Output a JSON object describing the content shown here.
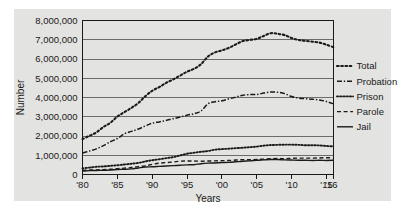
{
  "chart_data": {
    "type": "line",
    "title": "",
    "xlabel": "Years",
    "ylabel": "Number",
    "x": [
      1980,
      1981,
      1982,
      1983,
      1984,
      1985,
      1986,
      1987,
      1988,
      1989,
      1990,
      1991,
      1992,
      1993,
      1994,
      1995,
      1996,
      1997,
      1998,
      1999,
      2000,
      2001,
      2002,
      2003,
      2004,
      2005,
      2006,
      2007,
      2008,
      2009,
      2010,
      2011,
      2012,
      2013,
      2014,
      2015,
      2016
    ],
    "xtick_labels": [
      "'80",
      "'85",
      "'90",
      "'95",
      "'00",
      "'05",
      "'10",
      "'15",
      "'16"
    ],
    "xtick_values": [
      1980,
      1985,
      1990,
      1995,
      2000,
      2005,
      2010,
      2015,
      2016
    ],
    "ytick_labels": [
      "0",
      "1,000,000",
      "2,000,000",
      "3,000,000",
      "4,000,000",
      "5,000,000",
      "6,000,000",
      "7,000,000",
      "8,000,000"
    ],
    "ytick_values": [
      0,
      1000000,
      2000000,
      3000000,
      4000000,
      5000000,
      6000000,
      7000000,
      8000000
    ],
    "xlim": [
      1980,
      2016
    ],
    "ylim": [
      0,
      8000000
    ],
    "grid": "horizontal",
    "legend_position": "right",
    "series": [
      {
        "name": "Total",
        "style": "dotted",
        "values": [
          1840000,
          2010000,
          2190000,
          2470000,
          2690000,
          3010000,
          3240000,
          3460000,
          3710000,
          4060000,
          4350000,
          4540000,
          4760000,
          4940000,
          5140000,
          5340000,
          5490000,
          5730000,
          6130000,
          6340000,
          6450000,
          6580000,
          6760000,
          6930000,
          6990000,
          7050000,
          7200000,
          7340000,
          7310000,
          7240000,
          7090000,
          6990000,
          6940000,
          6900000,
          6850000,
          6740000,
          6610000
        ]
      },
      {
        "name": "Probation",
        "style": "dash-dot",
        "values": [
          1120000,
          1220000,
          1330000,
          1500000,
          1700000,
          1870000,
          2110000,
          2240000,
          2360000,
          2520000,
          2670000,
          2730000,
          2810000,
          2900000,
          2980000,
          3080000,
          3160000,
          3300000,
          3670000,
          3780000,
          3830000,
          3930000,
          4020000,
          4120000,
          4150000,
          4160000,
          4230000,
          4290000,
          4270000,
          4200000,
          4050000,
          3970000,
          3940000,
          3910000,
          3870000,
          3790000,
          3670000
        ]
      },
      {
        "name": "Prison",
        "style": "fine-dotted",
        "values": [
          320000,
          360000,
          400000,
          420000,
          450000,
          480000,
          520000,
          560000,
          600000,
          680000,
          740000,
          790000,
          850000,
          900000,
          990000,
          1080000,
          1130000,
          1180000,
          1220000,
          1290000,
          1320000,
          1340000,
          1370000,
          1390000,
          1420000,
          1450000,
          1500000,
          1530000,
          1540000,
          1550000,
          1550000,
          1540000,
          1520000,
          1520000,
          1510000,
          1480000,
          1460000
        ]
      },
      {
        "name": "Parole",
        "style": "dashed",
        "values": [
          220000,
          230000,
          240000,
          250000,
          270000,
          300000,
          330000,
          360000,
          410000,
          450000,
          530000,
          590000,
          620000,
          650000,
          690000,
          700000,
          700000,
          690000,
          700000,
          710000,
          720000,
          730000,
          750000,
          770000,
          770000,
          780000,
          800000,
          820000,
          830000,
          820000,
          840000,
          850000,
          850000,
          850000,
          860000,
          870000,
          870000
        ]
      },
      {
        "name": "Jail",
        "style": "solid",
        "values": [
          180000,
          200000,
          210000,
          220000,
          230000,
          260000,
          270000,
          290000,
          340000,
          390000,
          400000,
          420000,
          440000,
          460000,
          480000,
          500000,
          510000,
          560000,
          590000,
          600000,
          620000,
          630000,
          660000,
          690000,
          710000,
          740000,
          760000,
          780000,
          780000,
          760000,
          750000,
          740000,
          740000,
          730000,
          740000,
          730000,
          740000
        ]
      }
    ]
  },
  "axes": {
    "y_title": "Number",
    "x_title": "Years"
  },
  "legend": {
    "items": [
      {
        "label": "Total",
        "style": "dotted"
      },
      {
        "label": "Probation",
        "style": "dash-dot"
      },
      {
        "label": "Prison",
        "style": "fine-dotted"
      },
      {
        "label": "Parole",
        "style": "dashed"
      },
      {
        "label": "Jail",
        "style": "solid"
      }
    ]
  },
  "colors": {
    "panel_background": "#e3e3e1",
    "page_background": "#ffffff",
    "line": "#1a1a1a",
    "grid": "#6b6b6b",
    "axis": "#1a1a1a"
  }
}
